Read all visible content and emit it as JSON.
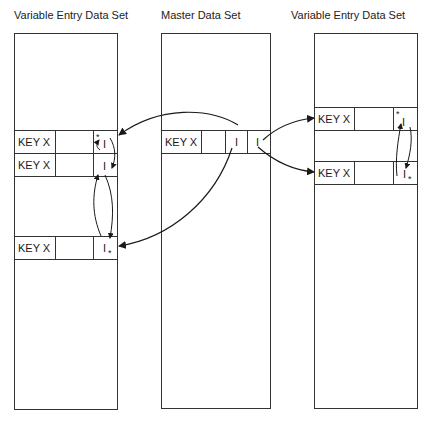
{
  "titles": {
    "left": "Variable Entry Data Set",
    "middle": "Master Data Set",
    "right": "Variable Entry Data Set"
  },
  "left_set": {
    "records": [
      {
        "key": "KEY X",
        "data": "",
        "pointer": "I",
        "marker": "*",
        "marker_pos": "top-left"
      },
      {
        "key": "KEY X",
        "data": "",
        "pointer": "I",
        "marker": "",
        "marker_pos": ""
      },
      {
        "key": "KEY X",
        "data": "",
        "pointer": "I",
        "marker": "*",
        "marker_pos": "bottom-right"
      }
    ]
  },
  "master_set": {
    "records": [
      {
        "key": "KEY X",
        "data": "",
        "pointer_1": "I",
        "pointer_2": "I"
      }
    ]
  },
  "right_set": {
    "records": [
      {
        "key": "KEY X",
        "data": "",
        "pointer": "I",
        "marker": "*",
        "marker_pos": "top-left"
      },
      {
        "key": "KEY X",
        "data": "",
        "pointer": "I",
        "marker": "*",
        "marker_pos": "bottom-right"
      }
    ]
  },
  "colors": {
    "line": "#333333",
    "background": "#ffffff"
  }
}
